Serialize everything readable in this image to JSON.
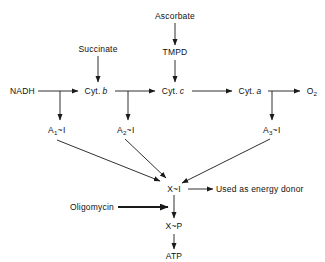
{
  "diagram": {
    "background_color": "#ffffff",
    "line_color": "#1a1a1a",
    "text_color": "#111111",
    "nodes": {
      "ascorbate": "Ascorbate",
      "tmpd": "TMPD",
      "succinate": "Succinate",
      "nadh": "NADH",
      "cyt_b_prefix": "Cyt.",
      "cyt_b_letter": "b",
      "cyt_c_prefix": "Cyt.",
      "cyt_c_letter": "c",
      "cyt_a_prefix": "Cyt.",
      "cyt_a_letter": "a",
      "oxygen_base": "O",
      "oxygen_sub": "2",
      "a1_base": "A",
      "a1_sub": "1",
      "a1_tail": "~I",
      "a2_base": "A",
      "a2_sub": "2",
      "a2_tail": "~I",
      "a3_base": "A",
      "a3_sub": "3",
      "a3_tail": "~I",
      "x_i": "X~I",
      "x_p": "X~P",
      "atp": "ATP",
      "energy_donor": "Used as energy donor",
      "oligomycin": "Oligomycin"
    }
  }
}
